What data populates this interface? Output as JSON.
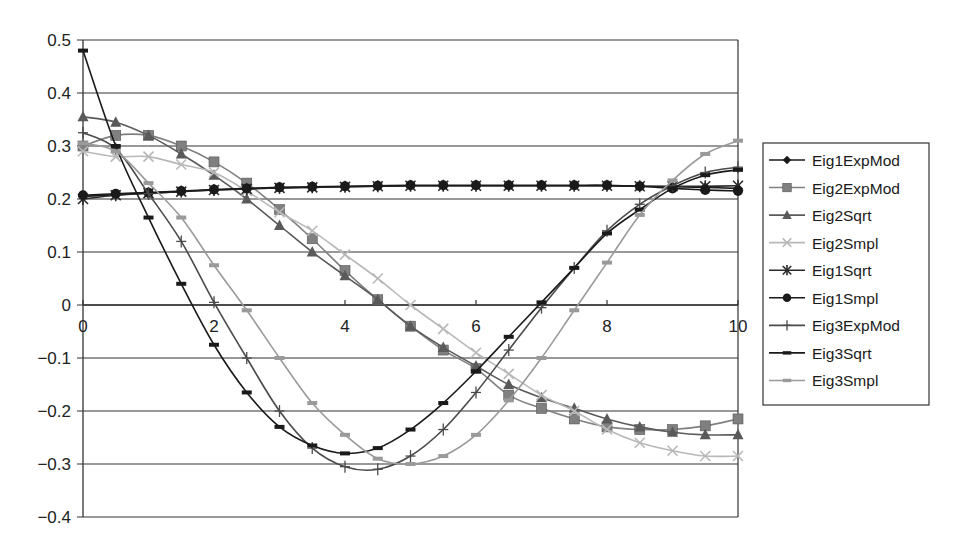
{
  "chart_data": {
    "type": "line",
    "title": "",
    "xlabel": "",
    "ylabel": "",
    "xlim": [
      0,
      10
    ],
    "ylim": [
      -0.4,
      0.5
    ],
    "grid": {
      "horizontal": true,
      "vertical": false
    },
    "legend_position": "right",
    "x_ticks": [
      0,
      2,
      4,
      6,
      8,
      10
    ],
    "x_tick_labels": [
      "0",
      "2",
      "4",
      "6",
      "8",
      "10"
    ],
    "y_ticks": [
      0.5,
      0.4,
      0.3,
      0.2,
      0.1,
      0,
      -0.1,
      -0.2,
      -0.3,
      -0.4
    ],
    "y_tick_labels": [
      "0.5",
      "0.4",
      "0.3",
      "0.2",
      "0.1",
      "0",
      "−0.1",
      "−0.2",
      "−0.3",
      "−0.4"
    ],
    "x": [
      0,
      0.5,
      1,
      1.5,
      2,
      2.5,
      3,
      3.5,
      4,
      4.5,
      5,
      5.5,
      6,
      6.5,
      7,
      7.5,
      8,
      8.5,
      9,
      9.5,
      10
    ],
    "series": [
      {
        "name": "Eig1ExpMod",
        "color": "#1a1a1a",
        "marker": "diamond",
        "values": [
          0.205,
          0.208,
          0.211,
          0.214,
          0.217,
          0.219,
          0.221,
          0.222,
          0.223,
          0.224,
          0.225,
          0.225,
          0.225,
          0.225,
          0.225,
          0.225,
          0.225,
          0.224,
          0.223,
          0.222,
          0.22
        ]
      },
      {
        "name": "Eig2ExpMod",
        "color": "#808080",
        "marker": "square",
        "values": [
          0.3,
          0.32,
          0.32,
          0.3,
          0.27,
          0.23,
          0.18,
          0.125,
          0.065,
          0.01,
          -0.04,
          -0.085,
          -0.12,
          -0.17,
          -0.195,
          -0.215,
          -0.23,
          -0.235,
          -0.235,
          -0.228,
          -0.215
        ]
      },
      {
        "name": "Eig2Sqrt",
        "color": "#5a5a5a",
        "marker": "triangle",
        "values": [
          0.355,
          0.345,
          0.32,
          0.285,
          0.245,
          0.2,
          0.15,
          0.1,
          0.055,
          0.01,
          -0.04,
          -0.08,
          -0.115,
          -0.15,
          -0.175,
          -0.195,
          -0.215,
          -0.23,
          -0.24,
          -0.245,
          -0.245
        ]
      },
      {
        "name": "Eig2Smpl",
        "color": "#b8b8b8",
        "marker": "x",
        "values": [
          0.29,
          0.28,
          0.28,
          0.265,
          0.25,
          0.215,
          0.175,
          0.14,
          0.095,
          0.05,
          0.0,
          -0.045,
          -0.09,
          -0.13,
          -0.17,
          -0.2,
          -0.235,
          -0.26,
          -0.275,
          -0.285,
          -0.285
        ]
      },
      {
        "name": "Eig1Sqrt",
        "color": "#2a2a2a",
        "marker": "star",
        "values": [
          0.2,
          0.207,
          0.211,
          0.214,
          0.217,
          0.219,
          0.221,
          0.222,
          0.223,
          0.224,
          0.225,
          0.225,
          0.225,
          0.225,
          0.225,
          0.225,
          0.225,
          0.224,
          0.224,
          0.224,
          0.225
        ]
      },
      {
        "name": "Eig1Smpl",
        "color": "#1a1a1a",
        "marker": "circle",
        "values": [
          0.207,
          0.21,
          0.212,
          0.215,
          0.218,
          0.22,
          0.222,
          0.223,
          0.224,
          0.225,
          0.226,
          0.226,
          0.226,
          0.226,
          0.226,
          0.226,
          0.226,
          0.224,
          0.22,
          0.217,
          0.215
        ]
      },
      {
        "name": "Eig3ExpMod",
        "color": "#4a4a4a",
        "marker": "plus",
        "values": [
          0.325,
          0.295,
          0.21,
          0.12,
          0.005,
          -0.1,
          -0.2,
          -0.27,
          -0.305,
          -0.31,
          -0.285,
          -0.235,
          -0.165,
          -0.085,
          -0.005,
          0.07,
          0.14,
          0.19,
          0.225,
          0.25,
          0.26
        ]
      },
      {
        "name": "Eig3Sqrt",
        "color": "#1a1a1a",
        "marker": "dash",
        "values": [
          0.48,
          0.3,
          0.165,
          0.04,
          -0.075,
          -0.165,
          -0.23,
          -0.265,
          -0.28,
          -0.27,
          -0.235,
          -0.185,
          -0.125,
          -0.06,
          0.005,
          0.07,
          0.135,
          0.18,
          0.22,
          0.245,
          0.255
        ]
      },
      {
        "name": "Eig3Smpl",
        "color": "#9a9a9a",
        "marker": "dash",
        "values": [
          0.305,
          0.29,
          0.23,
          0.165,
          0.075,
          -0.01,
          -0.1,
          -0.185,
          -0.245,
          -0.29,
          -0.3,
          -0.285,
          -0.245,
          -0.18,
          -0.1,
          -0.01,
          0.08,
          0.17,
          0.235,
          0.285,
          0.31
        ]
      }
    ]
  },
  "layout": {
    "plot": {
      "left": 83,
      "right": 738,
      "top": 40,
      "bottom": 517,
      "zero_y": 305
    },
    "legend": {
      "x": 763,
      "y": 143,
      "width": 166,
      "height": 262
    }
  }
}
